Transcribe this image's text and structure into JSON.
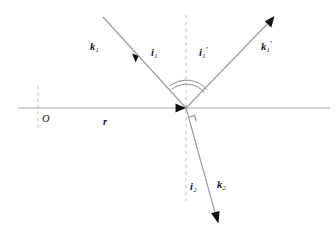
{
  "figure": {
    "type": "optics-ray-diagram",
    "colors": {
      "ray": "#9a9a9a",
      "interface": "#a6a6a6",
      "dashed": "#bfbfbf",
      "arc": "#8d8d8d",
      "arrowhead": "#101010",
      "text": "#151515",
      "background": "#ffffff"
    },
    "geometry": {
      "vertex": [
        186,
        108
      ],
      "interface_line": {
        "x1": 18,
        "y1": 108,
        "x2": 330,
        "y2": 108
      },
      "normal_dashed": {
        "x1": 186,
        "y1": 15,
        "x2": 186,
        "y2": 201
      },
      "origin_dashed": {
        "x1": 38,
        "y1": 86,
        "x2": 38,
        "y2": 129
      },
      "incident_ray": {
        "x1": 103,
        "y1": 17,
        "x2": 186,
        "y2": 108
      },
      "reflected_ray": {
        "x1": 186,
        "y1": 108,
        "x2": 274,
        "y2": 17
      },
      "refracted_ray": {
        "x1": 186,
        "y1": 108,
        "x2": 219,
        "y2": 223
      },
      "arc_radii": [
        26,
        30
      ],
      "right_angle_mark": [
        193,
        120
      ]
    }
  },
  "labels": {
    "incident_vector": {
      "base": "k",
      "sub": "1",
      "prime": "",
      "x": 90,
      "y": 46
    },
    "incident_angle": {
      "base": "i",
      "sub": "1",
      "prime": "",
      "x": 151,
      "y": 52
    },
    "reflected_angle": {
      "base": "i",
      "sub": "1",
      "prime": "′",
      "x": 199,
      "y": 52
    },
    "reflected_vector": {
      "base": "k",
      "sub": "1",
      "prime": "′",
      "x": 261,
      "y": 46
    },
    "refracted_angle": {
      "base": "i",
      "sub": "2",
      "prime": "",
      "x": 190,
      "y": 186
    },
    "refracted_vector": {
      "base": "k",
      "sub": "2",
      "prime": "",
      "x": 217,
      "y": 184
    },
    "origin_point": {
      "text": "O",
      "x": 42,
      "y": 114
    },
    "interface_vector": {
      "base": "r",
      "sub": "",
      "prime": "",
      "x": 103,
      "y": 121
    }
  }
}
